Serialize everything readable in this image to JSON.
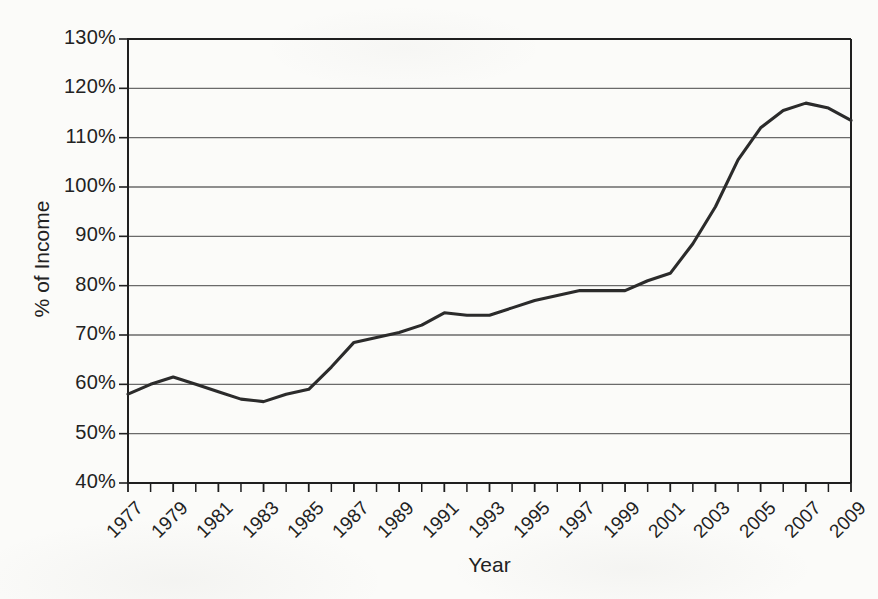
{
  "chart_data": {
    "type": "line",
    "title": "",
    "xlabel": "Year",
    "ylabel": "% of Income",
    "xlim": [
      1977,
      2009
    ],
    "ylim": [
      40,
      130
    ],
    "grid": true,
    "legend": "none",
    "x_tick_labels": [
      "1977",
      "1979",
      "1981",
      "1983",
      "1985",
      "1987",
      "1989",
      "1991",
      "1993",
      "1995",
      "1997",
      "1999",
      "2001",
      "2003",
      "2005",
      "2007",
      "2009"
    ],
    "x_tick_step_years": 2,
    "minor_tick_step_years": 1,
    "y_tick_labels": [
      "130%",
      "120%",
      "110%",
      "100%",
      "90%",
      "80%",
      "70%",
      "60%",
      "50%",
      "40%"
    ],
    "y_tick_values": [
      130,
      120,
      110,
      100,
      90,
      80,
      70,
      60,
      50,
      40
    ],
    "series": [
      {
        "name": "Household debt as % of income",
        "color": "#2b2b2b",
        "x": [
          1977,
          1978,
          1979,
          1980,
          1981,
          1982,
          1983,
          1984,
          1985,
          1986,
          1987,
          1988,
          1989,
          1990,
          1991,
          1992,
          1993,
          1994,
          1995,
          1996,
          1997,
          1998,
          1999,
          2000,
          2001,
          2002,
          2003,
          2004,
          2005,
          2006,
          2007,
          2008,
          2009
        ],
        "values": [
          58.0,
          60.0,
          61.5,
          60.0,
          58.5,
          57.0,
          56.5,
          58.0,
          59.0,
          63.5,
          68.5,
          69.5,
          70.5,
          72.0,
          74.5,
          74.0,
          74.0,
          75.5,
          77.0,
          78.0,
          79.0,
          79.0,
          79.0,
          81.0,
          82.5,
          88.5,
          96.0,
          105.5,
          112.0,
          115.5,
          117.0,
          116.0,
          113.5
        ]
      }
    ]
  },
  "axis": {
    "y_title": "% of Income",
    "x_title": "Year"
  },
  "colors": {
    "line": "#2b2b2b",
    "grid": "#6a6a6a",
    "axis": "#1f1f1f",
    "background": "#fbfbf9",
    "text": "#222222"
  }
}
